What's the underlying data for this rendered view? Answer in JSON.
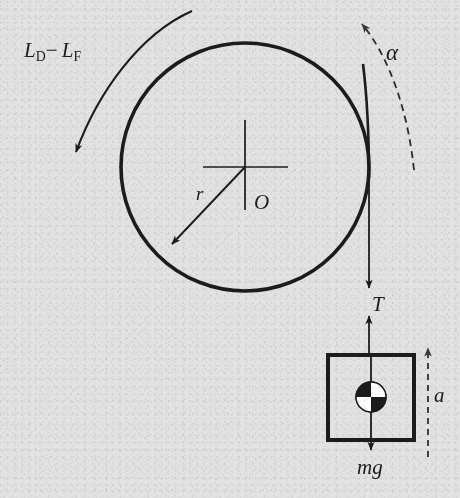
{
  "figure": {
    "width": 460,
    "height": 498,
    "background_color": "#e2e2e2",
    "ink_color": "#1c1c1c"
  },
  "labels": {
    "torque": {
      "base": "L",
      "sub1": "D",
      "operator": "−",
      "base2": "L",
      "sub2": "F",
      "text": "L_D − L_F"
    },
    "angular_acceleration": {
      "text": "α"
    },
    "radius": {
      "text": "r"
    },
    "origin": {
      "text": "O"
    },
    "tension": {
      "text": "T"
    },
    "weight": {
      "text": "mg"
    },
    "linear_acceleration": {
      "text": "a"
    }
  },
  "geometry": {
    "wheel": {
      "center_x": 245,
      "center_y": 167,
      "radius": 124,
      "stroke_width": 3.6
    },
    "axis_cross": {
      "center_x": 245,
      "center_y": 167,
      "arm_left": 42,
      "arm_right": 43,
      "arm_up": 47,
      "arm_down": 43
    },
    "radius_arrow": {
      "from_x": 245,
      "from_y": 167,
      "to_x": 168,
      "to_y": 248,
      "angle_deg": 225
    },
    "torque_arc": {
      "start_x": 190,
      "start_y": 12,
      "end_x": 74,
      "end_y": 158,
      "direction": "clockwise",
      "style": "solid"
    },
    "alpha_arc": {
      "start_x": 415,
      "start_y": 168,
      "end_x": 358,
      "end_y": 18,
      "direction": "counterclockwise",
      "style": "dashed"
    },
    "string": {
      "x": 369,
      "top_y": 80,
      "bottom_y": 355,
      "tangent_to_wheel": true
    },
    "tension_arrow_down": {
      "x": 369,
      "from_y": 180,
      "to_y": 286
    },
    "tension_arrow_up": {
      "x": 369,
      "from_y": 352,
      "to_y": 314
    },
    "block": {
      "left": 328,
      "top": 355,
      "width": 86,
      "height": 85,
      "stroke_width": 4
    },
    "com_symbol": {
      "center_x": 371,
      "center_y": 397,
      "radius": 15,
      "quadrants": [
        "black",
        "white",
        "white",
        "black"
      ]
    },
    "weight_arrow": {
      "x": 371,
      "from_y": 355,
      "to_y": 452
    },
    "accel_arrow": {
      "x": 428,
      "from_y": 455,
      "to_y": 346,
      "style": "dashed",
      "direction": "up"
    }
  }
}
